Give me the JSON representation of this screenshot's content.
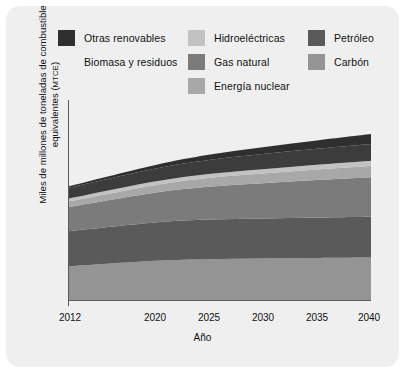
{
  "figure": {
    "background": "#efefef",
    "page_background": "#ffffff"
  },
  "legend": {
    "position": "top",
    "items": [
      {
        "label": "Otras renovables",
        "color": "#2f2f2f",
        "key": "otras_renovables"
      },
      {
        "label": "Biomasa y residuos",
        "color": "#3c3c3c",
        "key": "biomasa_residuos"
      },
      {
        "label": "Hidroeléctricas",
        "color": "#c2c2c2",
        "key": "hidroelectricas"
      },
      {
        "label": "Gas natural",
        "color": "#7b7b7b",
        "key": "gas_natural"
      },
      {
        "label": "Energía nuclear",
        "color": "#a8a8a8",
        "key": "energia_nuclear"
      },
      {
        "label": "Petróleo",
        "color": "#5a5a5a",
        "key": "petroleo"
      },
      {
        "label": "Carbón",
        "color": "#949494",
        "key": "carbon"
      }
    ]
  },
  "axes": {
    "ylabel_line1": "Miles de millones de toneladas de combustible",
    "ylabel_line2": "equivalentes (",
    "ylabel_unit": "MTCE",
    "ylabel_line2_end": ")",
    "xlabel": "Año",
    "xticks": [
      "2012",
      "2020",
      "2025",
      "2030",
      "2035",
      "2040"
    ]
  },
  "chart_data": {
    "type": "area",
    "stacked": true,
    "title": "",
    "xlabel": "Año",
    "ylabel": "Miles de millones de toneladas de combustible equivalentes (MTCE)",
    "x": [
      2012,
      2020,
      2025,
      2030,
      2035,
      2040
    ],
    "xlim": [
      2012,
      2040
    ],
    "ylim": [
      0,
      25
    ],
    "grid": false,
    "legend_position": "top",
    "yticks_shown": false,
    "stack_order_bottom_to_top": [
      "Carbón",
      "Petróleo",
      "Gas natural",
      "Energía nuclear",
      "Hidroeléctricas",
      "Biomasa y residuos",
      "Otras renovables"
    ],
    "series": [
      {
        "name": "Carbón",
        "color": "#949494",
        "values": [
          4.2,
          4.9,
          5.1,
          5.2,
          5.25,
          5.3
        ]
      },
      {
        "name": "Petróleo",
        "color": "#5a5a5a",
        "values": [
          4.4,
          4.8,
          4.95,
          5.0,
          5.05,
          5.1
        ]
      },
      {
        "name": "Gas natural",
        "color": "#7b7b7b",
        "values": [
          3.0,
          3.7,
          4.1,
          4.4,
          4.7,
          4.95
        ]
      },
      {
        "name": "Energía nuclear",
        "color": "#a8a8a8",
        "values": [
          0.7,
          0.95,
          1.1,
          1.2,
          1.3,
          1.4
        ]
      },
      {
        "name": "Hidroeléctricas",
        "color": "#c2c2c2",
        "values": [
          0.35,
          0.45,
          0.5,
          0.55,
          0.6,
          0.65
        ]
      },
      {
        "name": "Biomasa y residuos",
        "color": "#3c3c3c",
        "values": [
          1.35,
          1.6,
          1.75,
          1.9,
          2.0,
          2.1
        ]
      },
      {
        "name": "Otras renovables",
        "color": "#2f2f2f",
        "values": [
          0.2,
          0.45,
          0.65,
          0.85,
          1.05,
          1.25
        ]
      }
    ],
    "totals": [
      14.2,
      16.85,
      18.15,
      19.1,
      19.95,
      20.75
    ]
  }
}
